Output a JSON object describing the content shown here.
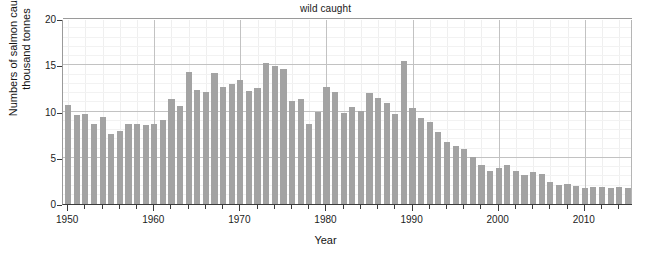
{
  "chart_data": {
    "type": "bar",
    "title": "wild caught",
    "xlabel": "Year",
    "ylabel": "Numbers of salmon caught/ thousand tonnes",
    "ylabel_line1": "Numbers of salmon caught/",
    "ylabel_line2": "thousand tonnes",
    "series_name": "wild caught salmon",
    "xlim": [
      1949.4,
      2015.6
    ],
    "ylim": [
      0,
      20
    ],
    "yticks": [
      0,
      5,
      10,
      15,
      20
    ],
    "ytick_labels": [
      "0",
      "5",
      "10",
      "15",
      "20"
    ],
    "xticks": [
      1950,
      1960,
      1970,
      1980,
      1990,
      2000,
      2010
    ],
    "xtick_labels": [
      "1950",
      "1960",
      "1970",
      "1980",
      "1990",
      "2000",
      "2010"
    ],
    "xminor_tick_step": 2,
    "grid": "both",
    "legend": "none",
    "bar_color": "#a3a3a3",
    "grid_color": "#c2c2c2",
    "axis_color": "#3b3b3b",
    "categories": [
      1950,
      1951,
      1952,
      1953,
      1954,
      1955,
      1956,
      1957,
      1958,
      1959,
      1960,
      1961,
      1962,
      1963,
      1964,
      1965,
      1966,
      1967,
      1968,
      1969,
      1970,
      1971,
      1972,
      1973,
      1974,
      1975,
      1976,
      1977,
      1978,
      1979,
      1980,
      1981,
      1982,
      1983,
      1984,
      1985,
      1986,
      1987,
      1988,
      1989,
      1990,
      1991,
      1992,
      1993,
      1994,
      1995,
      1996,
      1997,
      1998,
      1999,
      2000,
      2001,
      2002,
      2003,
      2004,
      2005,
      2006,
      2007,
      2008,
      2009,
      2010,
      2011,
      2012,
      2013,
      2014,
      2015
    ],
    "values": [
      10.7,
      9.6,
      9.7,
      8.7,
      9.4,
      7.6,
      7.9,
      8.7,
      8.6,
      8.5,
      8.7,
      9.1,
      11.4,
      10.6,
      14.3,
      12.3,
      12.1,
      14.2,
      12.7,
      13.0,
      13.4,
      12.2,
      12.5,
      15.2,
      14.9,
      14.6,
      11.1,
      11.3,
      8.6,
      9.9,
      12.7,
      12.1,
      9.8,
      10.5,
      10.1,
      12.0,
      11.5,
      10.9,
      9.7,
      15.5,
      10.4,
      9.3,
      8.9,
      7.8,
      6.7,
      6.3,
      5.9,
      5.1,
      4.2,
      3.6,
      3.9,
      4.2,
      3.6,
      3.1,
      3.5,
      3.2,
      2.4,
      2.1,
      2.2,
      1.9,
      1.7,
      1.8,
      1.8,
      1.7,
      1.8,
      1.7
    ],
    "peak": {
      "year": 1989,
      "value": 15.5
    },
    "max_value": 15.5,
    "min_value": 1.7,
    "units": "thousand tonnes"
  }
}
